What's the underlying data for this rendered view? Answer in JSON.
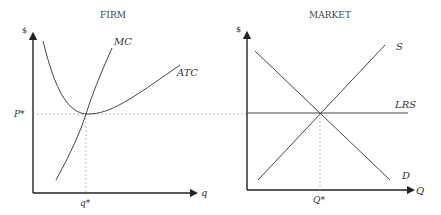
{
  "panels": [
    {
      "title": "FIRM",
      "y_label": "$",
      "x_label": "q",
      "price_label": "P*",
      "quantity_label": "q*",
      "curves": [
        {
          "name": "MC",
          "label": "MC",
          "shape": "upward-sloping"
        },
        {
          "name": "ATC",
          "label": "ATC",
          "shape": "U-shaped"
        }
      ]
    },
    {
      "title": "MARKET",
      "y_label": "$",
      "x_label": "Q",
      "quantity_label": "Q*",
      "curves": [
        {
          "name": "S",
          "label": "S",
          "shape": "upward-sloping"
        },
        {
          "name": "D",
          "label": "D",
          "shape": "downward-sloping"
        },
        {
          "name": "LRS",
          "label": "LRS",
          "shape": "horizontal"
        }
      ]
    }
  ],
  "firm": {
    "title": "FIRM",
    "y_label": "$",
    "x_label": "q",
    "p_star": "P*",
    "q_star": "q*",
    "mc": "MC",
    "atc": "ATC"
  },
  "market": {
    "title": "MARKET",
    "y_label": "$",
    "x_label": "Q",
    "q_star": "Q*",
    "s": "S",
    "d": "D",
    "lrs": "LRS"
  },
  "colors": {
    "axis": "#222222",
    "curve": "#444444",
    "guide": "#aaaaaa"
  }
}
